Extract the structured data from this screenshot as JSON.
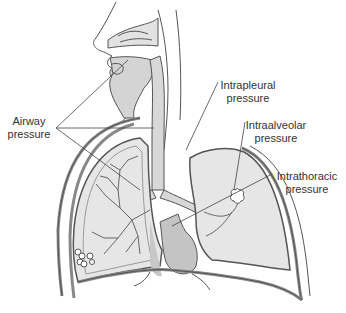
{
  "diagram": {
    "labels": {
      "airway": {
        "line1": "Airway",
        "line2": "pressure"
      },
      "intrapleural": {
        "line1": "Intrapleural",
        "line2": "pressure"
      },
      "intraalveolar": {
        "line1": "Intraalveolar",
        "line2": "pressure"
      },
      "intrathoracic": {
        "line1": "Intrathoracic",
        "line2": "pressure"
      }
    },
    "colors": {
      "outline": "#555555",
      "lung_fill": "#e6e6e6",
      "airway_fill": "#d4d4d4",
      "heart_fill": "#c4c4c4",
      "pleura": "#9a9a9a",
      "text": "#333333",
      "background": "#ffffff"
    }
  }
}
